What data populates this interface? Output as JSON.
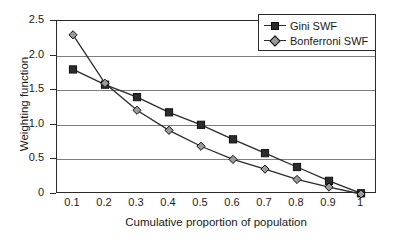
{
  "chart_data": {
    "type": "line",
    "title": "",
    "xlabel": "Cumulative proportion of population",
    "ylabel": "Weighting function",
    "x": [
      0.1,
      0.2,
      0.3,
      0.4,
      0.5,
      0.6,
      0.7,
      0.8,
      0.9,
      1.0
    ],
    "xtick_labels": [
      "0.1",
      "0.2",
      "0.3",
      "0.4",
      "0.5",
      "0.6",
      "0.7",
      "0.8",
      "0.9",
      "1"
    ],
    "ytick_labels": [
      "0",
      "0.5",
      "1.0",
      "1.5",
      "2.0",
      "2.5"
    ],
    "ytick_values": [
      0,
      0.5,
      1.0,
      1.5,
      2.0,
      2.5
    ],
    "xlim": [
      0.05,
      1.05
    ],
    "ylim": [
      0,
      2.5
    ],
    "grid": "horizontal",
    "legend_position": "top-right",
    "series": [
      {
        "name": "Gini SWF",
        "marker": "filled-square",
        "color": "#2b2b2b",
        "values": [
          1.8,
          1.58,
          1.4,
          1.18,
          1.0,
          0.79,
          0.59,
          0.39,
          0.19,
          0.01
        ]
      },
      {
        "name": "Bonferroni SWF",
        "marker": "diamond",
        "color": "#9a9a9a",
        "values": [
          2.3,
          1.6,
          1.21,
          0.92,
          0.69,
          0.5,
          0.36,
          0.21,
          0.1,
          0.0
        ]
      }
    ]
  },
  "legend": {
    "entries": [
      {
        "label": "Gini SWF"
      },
      {
        "label": "Bonferroni SWF"
      }
    ]
  },
  "axes": {
    "x_title": "Cumulative proportion of population",
    "y_title": "Weighting function"
  }
}
